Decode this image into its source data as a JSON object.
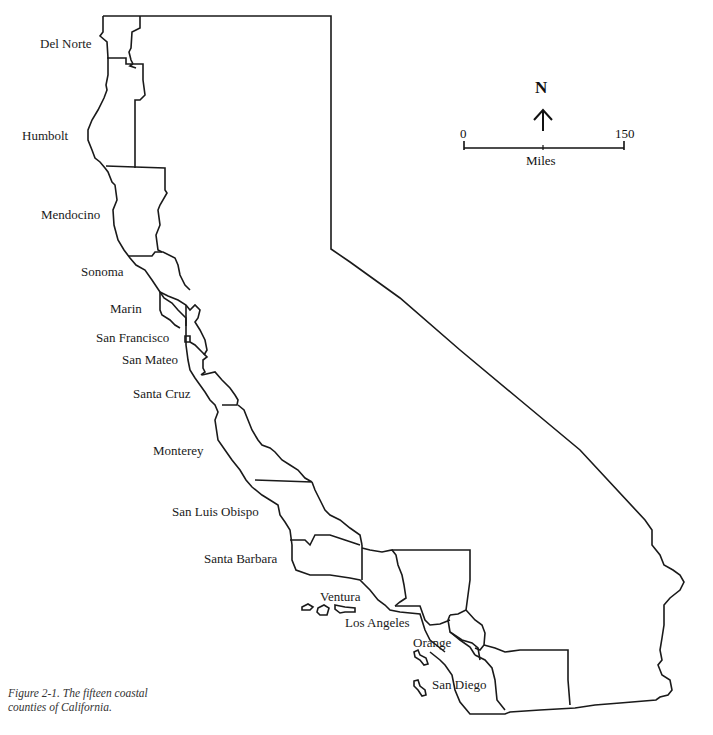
{
  "map": {
    "title": "Figure 2-1. The fifteen coastal counties of California.",
    "caption_line1": "Figure 2-1. The fifteen coastal",
    "caption_line2": "counties of California.",
    "north_arrow": {
      "letter": "N",
      "icon": "north-arrow-icon"
    },
    "scale_bar": {
      "start": "0",
      "end": "150",
      "unit": "Miles"
    },
    "counties": [
      {
        "name": "Del Norte"
      },
      {
        "name": "Humbolt"
      },
      {
        "name": "Mendocino"
      },
      {
        "name": "Sonoma"
      },
      {
        "name": "Marin"
      },
      {
        "name": "San Francisco"
      },
      {
        "name": "San Mateo"
      },
      {
        "name": "Santa Cruz"
      },
      {
        "name": "Monterey"
      },
      {
        "name": "San Luis Obispo"
      },
      {
        "name": "Santa Barbara"
      },
      {
        "name": "Ventura"
      },
      {
        "name": "Los Angeles"
      },
      {
        "name": "Orange"
      },
      {
        "name": "San Diego"
      }
    ]
  }
}
